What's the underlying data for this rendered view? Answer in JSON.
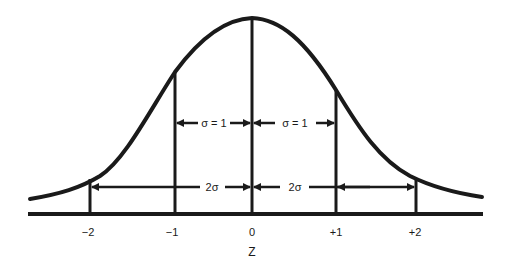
{
  "diagram": {
    "title": "",
    "type": "normal-distribution",
    "axis_label": "Z",
    "ticks": [
      {
        "label": "−2",
        "x": 90
      },
      {
        "label": "−1",
        "x": 175
      },
      {
        "label": "0",
        "x": 252
      },
      {
        "label": "+1",
        "x": 336
      },
      {
        "label": "+2",
        "x": 416
      }
    ],
    "annotations": {
      "sigma_left": "σ = 1",
      "sigma_right": "σ = 1",
      "two_sigma_left": "2σ",
      "two_sigma_right": "2σ"
    },
    "colors": {
      "ink": "#1a1a1a",
      "background": "#ffffff"
    }
  }
}
